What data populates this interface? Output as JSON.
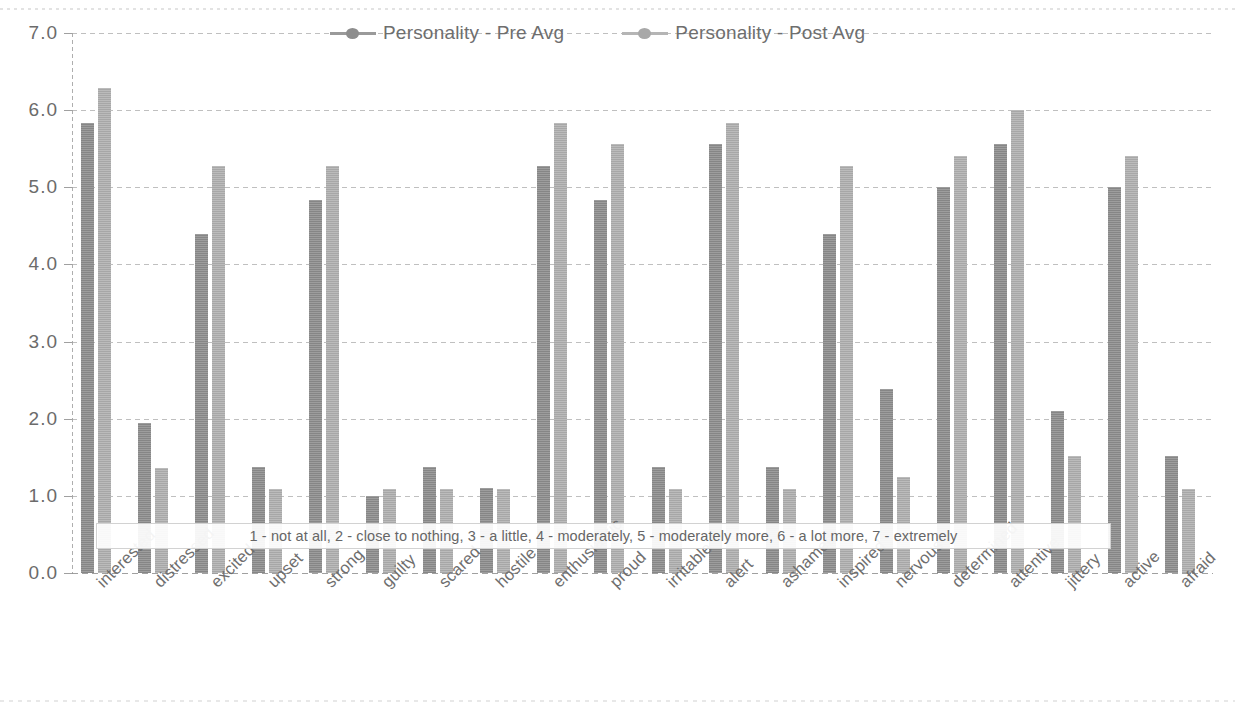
{
  "chart_data": {
    "type": "bar",
    "title": "",
    "subtitle": "",
    "xlabel": "",
    "ylabel": "",
    "ylim": [
      0.0,
      7.0
    ],
    "ytick_labels": [
      "7.0",
      "6.0",
      "5.0",
      "4.0",
      "3.0",
      "2.0",
      "1.0",
      "0.0"
    ],
    "ytick_values": [
      7.0,
      6.0,
      5.0,
      4.0,
      3.0,
      2.0,
      1.0,
      0.0
    ],
    "grid": true,
    "legend_position": "top-center",
    "categories": [
      "interested",
      "distressed",
      "excited",
      "upset",
      "strong",
      "guilty",
      "scared",
      "hostile",
      "enthusiastic",
      "proud",
      "irritable",
      "alert",
      "ashamed",
      "inspired",
      "nervous",
      "determined",
      "attentive",
      "jittery",
      "active",
      "afraid"
    ],
    "series": [
      {
        "name": "Personality - Pre Avg",
        "color": "#8d8d8d",
        "values": [
          5.84,
          1.95,
          4.4,
          1.38,
          4.84,
          1.0,
          1.38,
          1.1,
          5.27,
          4.84,
          1.38,
          5.56,
          1.38,
          4.4,
          2.38,
          5.0,
          5.56,
          2.1,
          5.0,
          1.52
        ]
      },
      {
        "name": "Personality - Post Avg",
        "color": "#b0b0b0",
        "values": [
          6.29,
          1.36,
          5.27,
          1.09,
          5.27,
          1.09,
          1.09,
          1.09,
          5.84,
          5.56,
          1.09,
          5.84,
          1.09,
          5.27,
          1.24,
          5.41,
          6.0,
          1.52,
          5.41,
          1.09
        ]
      }
    ],
    "annotations": [
      "1 - not at all, 2 -  close to nothing, 3 -  a little, 4 - moderately, 5 - moderately more, 6 -  a lot more, 7 - extremely"
    ]
  },
  "legend": {
    "items": [
      {
        "label": "Personality - Pre Avg"
      },
      {
        "label": "Personality - Post Avg"
      }
    ]
  },
  "note": {
    "text": "1 - not at all, 2 -  close to nothing, 3 -  a little, 4 - moderately, 5 - moderately more, 6 -  a lot more, 7 - extremely"
  }
}
